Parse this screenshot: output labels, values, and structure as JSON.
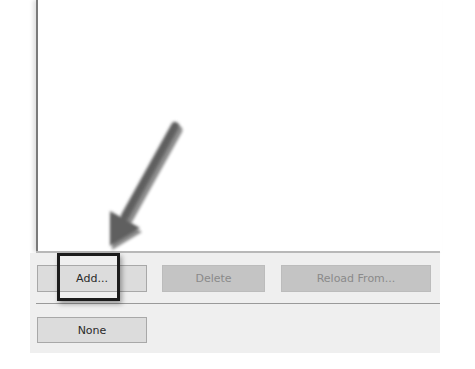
{
  "buttons": {
    "add": {
      "label": "Add...",
      "enabled": true
    },
    "delete": {
      "label": "Delete",
      "enabled": false
    },
    "reload_from": {
      "label": "Reload From...",
      "enabled": false
    },
    "none": {
      "label": "None",
      "enabled": true
    }
  },
  "annotation": {
    "arrow_color": "#5f5f5f",
    "highlight_color": "#1c1c1c",
    "target": "add-button"
  },
  "colors": {
    "panel_background": "#efefef",
    "button_enabled": "#dcdcdc",
    "button_disabled": "#c4c4c4",
    "text_enabled": "#2a2a2a",
    "text_disabled": "#8a8a8a"
  }
}
